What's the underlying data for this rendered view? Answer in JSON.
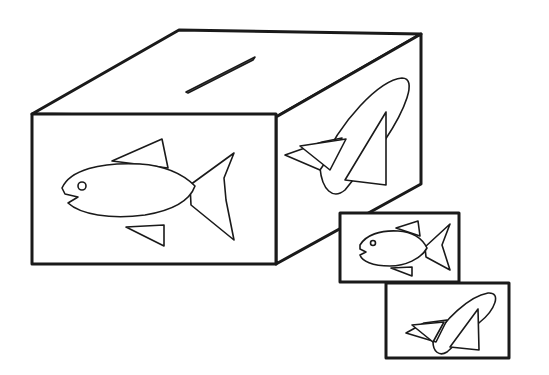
{
  "illustration": {
    "subject": "ballot box",
    "colors": {
      "line": "#1a1a1a",
      "background": "#ffffff"
    },
    "box": {
      "top_slot": "slot",
      "front_symbol": "fish",
      "side_symbol": "space-shuttle"
    },
    "cards": [
      {
        "symbol": "fish"
      },
      {
        "symbol": "space-shuttle"
      }
    ]
  }
}
